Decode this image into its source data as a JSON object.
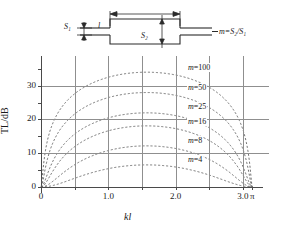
{
  "schematic": {
    "name": "expansion-chamber-schematic",
    "length_label": "l",
    "inlet_area_label": "S1",
    "inlet_area_html": "S₁",
    "chamber_area_label": "S2",
    "chamber_area_html": "S₂",
    "formula": "m=S₂/S₁",
    "formula_lhs": "m=",
    "formula_num": "S₂",
    "formula_den": "S₁",
    "line_color": "#2b2b2b"
  },
  "chart_data": {
    "type": "line",
    "title": "",
    "xlabel": "kl",
    "ylabel": "TL/dB",
    "xlim": [
      0,
      3.3
    ],
    "ylim": [
      0,
      37
    ],
    "xticks": [
      0,
      0.5,
      1.0,
      1.5,
      2.0,
      2.5,
      3.0,
      3.14159
    ],
    "xtick_labels": [
      "0",
      "",
      "1.0",
      "",
      "2.0",
      "",
      "3.0",
      "π"
    ],
    "yticks": [
      0,
      5,
      10,
      15,
      20,
      25,
      30,
      35
    ],
    "ytick_labels": [
      "0",
      "",
      "10",
      "",
      "20",
      "",
      "30",
      ""
    ],
    "grid": "both-major",
    "grid_color": "#8f8f8f",
    "curve_style": "dashed",
    "curve_color": "#5a5a5a",
    "legend": "inline-labels",
    "formula": "TL = 10 log10(1 + ((m - 1/m)/2)^2 sin^2(kl))",
    "series": [
      {
        "name": "m=100",
        "m": 100,
        "peak_value": 34.0,
        "label_x": 2.17,
        "label_y": 35.2
      },
      {
        "name": "m=50",
        "m": 50,
        "peak_value": 28.0,
        "label_x": 2.17,
        "label_y": 29.4
      },
      {
        "name": "m=25",
        "m": 25,
        "peak_value": 22.0,
        "label_x": 2.17,
        "label_y": 23.6
      },
      {
        "name": "m=16",
        "m": 16,
        "peak_value": 18.1,
        "label_x": 2.17,
        "label_y": 19.3
      },
      {
        "name": "m=8",
        "m": 8,
        "peak_value": 12.4,
        "label_x": 2.17,
        "label_y": 13.6
      },
      {
        "name": "m=4",
        "m": 4,
        "peak_value": 6.6,
        "label_x": 2.17,
        "label_y": 8.0
      }
    ]
  }
}
